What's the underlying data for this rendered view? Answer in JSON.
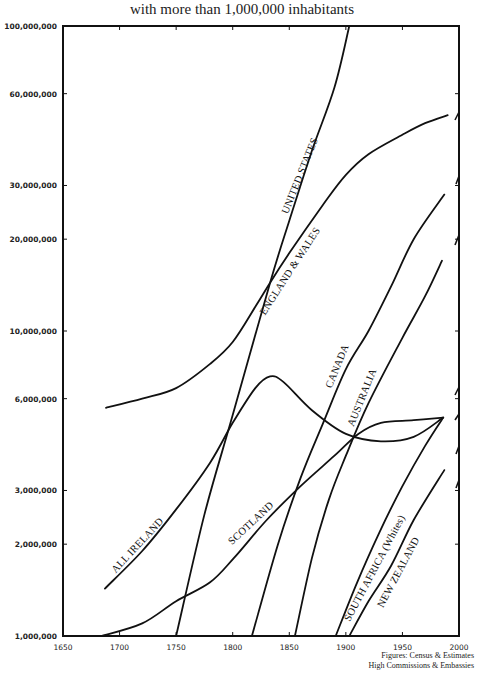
{
  "chart_data": {
    "type": "line",
    "title": "with more than 1,000,000 inhabitants",
    "xlabel": "",
    "ylabel": "",
    "yscale": "log",
    "xlim": [
      1650,
      2000
    ],
    "ylim": [
      1000000,
      100000000
    ],
    "grid": false,
    "legend": "inline labels along curves",
    "x_ticks": [
      "1650",
      "1700",
      "1750",
      "1800",
      "1850",
      "1900",
      "1950",
      "2000"
    ],
    "y_ticks": [
      {
        "value": 1000000,
        "label": "1,000,000"
      },
      {
        "value": 2000000,
        "label": "2,000,000"
      },
      {
        "value": 3000000,
        "label": "3,000,000"
      },
      {
        "value": 6000000,
        "label": "6,000,000"
      },
      {
        "value": 10000000,
        "label": "10,000,000"
      },
      {
        "value": 20000000,
        "label": "20,000,000"
      },
      {
        "value": 30000000,
        "label": "30,000,000"
      },
      {
        "value": 60000000,
        "label": "60,000,000"
      },
      {
        "value": 100000000,
        "label": "100,000,000"
      }
    ],
    "series": [
      {
        "name": "UNITED STATES",
        "label_pos": {
          "year": 1862,
          "value": 32000000,
          "angle": -68
        },
        "points": [
          [
            1750,
            1000000
          ],
          [
            1775,
            2500000
          ],
          [
            1800,
            5300000
          ],
          [
            1833,
            14400000
          ],
          [
            1850,
            23000000
          ],
          [
            1870,
            39000000
          ],
          [
            1890,
            63000000
          ],
          [
            1903,
            100000000
          ]
        ]
      },
      {
        "name": "ENGLAND & WALES",
        "label_pos": {
          "year": 1853,
          "value": 15500000,
          "angle": -57
        },
        "points": [
          [
            1688,
            5600000
          ],
          [
            1720,
            6000000
          ],
          [
            1750,
            6500000
          ],
          [
            1780,
            7800000
          ],
          [
            1800,
            9200000
          ],
          [
            1820,
            12000000
          ],
          [
            1833,
            14400000
          ],
          [
            1850,
            18000000
          ],
          [
            1880,
            26000000
          ],
          [
            1900,
            32500000
          ],
          [
            1920,
            38000000
          ],
          [
            1950,
            44000000
          ],
          [
            1970,
            48000000
          ],
          [
            1990,
            51000000
          ]
        ]
      },
      {
        "name": "ALL IRELAND",
        "label_pos": {
          "year": 1718,
          "value": 1950000,
          "angle": -47
        },
        "points": [
          [
            1687,
            1430000
          ],
          [
            1720,
            1900000
          ],
          [
            1750,
            2600000
          ],
          [
            1780,
            3700000
          ],
          [
            1800,
            5000000
          ],
          [
            1820,
            6500000
          ],
          [
            1833,
            7100000
          ],
          [
            1845,
            6800000
          ],
          [
            1870,
            5500000
          ],
          [
            1900,
            4600000
          ],
          [
            1931,
            4350000
          ],
          [
            1960,
            4500000
          ],
          [
            1986,
            5200000
          ]
        ]
      },
      {
        "name": "SCOTLAND",
        "label_pos": {
          "year": 1818,
          "value": 2300000,
          "angle": -43
        },
        "points": [
          [
            1684,
            1000000
          ],
          [
            1720,
            1100000
          ],
          [
            1750,
            1300000
          ],
          [
            1780,
            1500000
          ],
          [
            1801,
            1800000
          ],
          [
            1830,
            2400000
          ],
          [
            1860,
            3100000
          ],
          [
            1890,
            3900000
          ],
          [
            1911,
            4600000
          ],
          [
            1931,
            5000000
          ],
          [
            1960,
            5100000
          ],
          [
            1986,
            5200000
          ]
        ]
      },
      {
        "name": "CANADA",
        "label_pos": {
          "year": 1895,
          "value": 7600000,
          "angle": -68
        },
        "points": [
          [
            1817,
            1000000
          ],
          [
            1840,
            2000000
          ],
          [
            1860,
            3300000
          ],
          [
            1880,
            5000000
          ],
          [
            1900,
            7500000
          ],
          [
            1920,
            10000000
          ],
          [
            1940,
            14000000
          ],
          [
            1960,
            20000000
          ],
          [
            1987,
            28000000
          ]
        ]
      },
      {
        "name": "AUSTRALIA",
        "label_pos": {
          "year": 1917,
          "value": 6000000,
          "angle": -68
        },
        "points": [
          [
            1855,
            1000000
          ],
          [
            1870,
            1800000
          ],
          [
            1885,
            2800000
          ],
          [
            1900,
            3900000
          ],
          [
            1920,
            5800000
          ],
          [
            1950,
            9500000
          ],
          [
            1970,
            13000000
          ],
          [
            1985,
            17000000
          ]
        ]
      },
      {
        "name": "SOUTH AFRICA (Whites)",
        "label_pos": {
          "year": 1928,
          "value": 1650000,
          "angle": -62
        },
        "points": [
          [
            1891,
            1000000
          ],
          [
            1910,
            1500000
          ],
          [
            1930,
            2200000
          ],
          [
            1950,
            3100000
          ],
          [
            1970,
            4200000
          ],
          [
            1986,
            5200000
          ]
        ]
      },
      {
        "name": "NEW ZEALAND",
        "label_pos": {
          "year": 1949,
          "value": 1600000,
          "angle": -62
        },
        "points": [
          [
            1903,
            1000000
          ],
          [
            1920,
            1300000
          ],
          [
            1940,
            1700000
          ],
          [
            1960,
            2400000
          ],
          [
            1987,
            3500000
          ]
        ]
      }
    ],
    "annotations": [
      "Figures: Census & Estimates",
      "High Commissions & Embassies"
    ]
  },
  "source_note": {
    "line1": "Figures: Census & Estimates",
    "line2": "High Commissions & Embassies"
  }
}
